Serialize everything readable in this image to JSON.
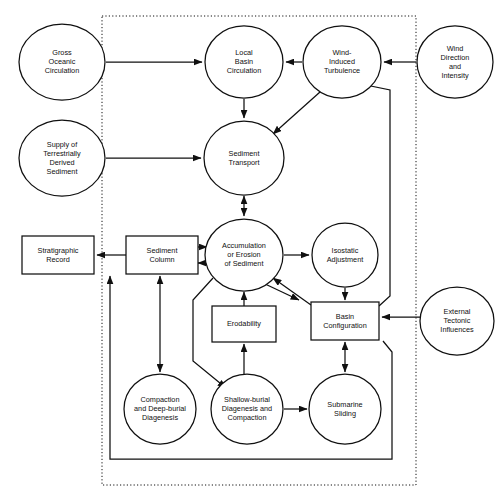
{
  "diagram": {
    "system_boundary_label": "",
    "style": {
      "stroke": "#101010",
      "fill": "#ffffff",
      "boundary_style": "dotted",
      "background": "#ffffff"
    },
    "nodes": [
      {
        "id": "gross_oceanic_circulation",
        "shape": "ellipse",
        "inside_boundary": false,
        "lines": [
          "Gross",
          "Oceanic",
          "Circulation"
        ],
        "cx": 62,
        "cy": 62,
        "rx": 43,
        "ry": 38
      },
      {
        "id": "supply_terrestrial_sediment",
        "shape": "ellipse",
        "inside_boundary": false,
        "lines": [
          "Supply of",
          "Terrestrially",
          "Derived",
          "Sediment"
        ],
        "cx": 62,
        "cy": 158,
        "rx": 43,
        "ry": 38
      },
      {
        "id": "local_basin_circulation",
        "shape": "ellipse",
        "inside_boundary": true,
        "lines": [
          "Local",
          "Basin",
          "Circulation"
        ],
        "cx": 244,
        "cy": 62,
        "rx": 39,
        "ry": 36
      },
      {
        "id": "wind_induced_turbulence",
        "shape": "ellipse",
        "inside_boundary": true,
        "lines": [
          "Wind-",
          "Induced",
          "Turbulence"
        ],
        "cx": 342,
        "cy": 62,
        "rx": 39,
        "ry": 36
      },
      {
        "id": "wind_direction_intensity",
        "shape": "ellipse",
        "inside_boundary": false,
        "lines": [
          "Wind",
          "Direction",
          "and",
          "Intensity"
        ],
        "cx": 455,
        "cy": 62,
        "rx": 38,
        "ry": 36
      },
      {
        "id": "sediment_transport",
        "shape": "ellipse",
        "inside_boundary": true,
        "lines": [
          "Sediment",
          "Transport"
        ],
        "cx": 244,
        "cy": 158,
        "rx": 40,
        "ry": 37
      },
      {
        "id": "stratigraphic_record",
        "shape": "rect",
        "inside_boundary": false,
        "lines": [
          "Stratigraphic",
          "Record"
        ],
        "x": 22,
        "y": 236,
        "w": 72,
        "h": 38
      },
      {
        "id": "sediment_column",
        "shape": "rect",
        "inside_boundary": true,
        "lines": [
          "Sediment",
          "Column"
        ],
        "x": 126,
        "y": 236,
        "w": 72,
        "h": 38
      },
      {
        "id": "accumulation_or_erosion",
        "shape": "ellipse",
        "inside_boundary": true,
        "lines": [
          "Accumulation",
          "or Erosion",
          "of Sediment"
        ],
        "cx": 244,
        "cy": 255,
        "rx": 39,
        "ry": 36
      },
      {
        "id": "isostatic_adjustment",
        "shape": "ellipse",
        "inside_boundary": true,
        "lines": [
          "Isostatic",
          "Adjustment"
        ],
        "cx": 345,
        "cy": 255,
        "rx": 33,
        "ry": 32
      },
      {
        "id": "erodability",
        "shape": "rect",
        "inside_boundary": true,
        "lines": [
          "Erodability"
        ],
        "x": 212,
        "y": 306,
        "w": 64,
        "h": 36
      },
      {
        "id": "basin_configuration",
        "shape": "rect",
        "inside_boundary": true,
        "lines": [
          "Basin",
          "Configuration"
        ],
        "x": 311,
        "y": 302,
        "w": 68,
        "h": 38
      },
      {
        "id": "external_tectonic_influences",
        "shape": "ellipse",
        "inside_boundary": false,
        "lines": [
          "External",
          "Tectonic",
          "Influences"
        ],
        "cx": 457,
        "cy": 321,
        "rx": 37,
        "ry": 34
      },
      {
        "id": "compaction_deep_burial",
        "shape": "ellipse",
        "inside_boundary": true,
        "lines": [
          "Compaction",
          "and Deep-burial",
          "Diagenesis"
        ],
        "cx": 160,
        "cy": 409,
        "rx": 36,
        "ry": 35
      },
      {
        "id": "shallow_burial_diagenesis",
        "shape": "ellipse",
        "inside_boundary": true,
        "lines": [
          "Shallow-burial",
          "Diagenesis and",
          "Compaction"
        ],
        "cx": 247,
        "cy": 409,
        "rx": 36,
        "ry": 35
      },
      {
        "id": "submarine_sliding",
        "shape": "ellipse",
        "inside_boundary": true,
        "lines": [
          "Submarine",
          "Sliding"
        ],
        "cx": 345,
        "cy": 409,
        "rx": 36,
        "ry": 35
      }
    ],
    "edges": [
      {
        "id": "gross-to-local",
        "from": "gross_oceanic_circulation",
        "to": "local_basin_circulation",
        "points": "106,62 202,62",
        "arrows": "end"
      },
      {
        "id": "wind-dir-to-turbulence",
        "from": "wind_direction_intensity",
        "to": "wind_induced_turbulence",
        "points": "416,62 384,62",
        "arrows": "end"
      },
      {
        "id": "turbulence-to-local",
        "from": "wind_induced_turbulence",
        "to": "local_basin_circulation",
        "points": "302,62 286,62",
        "arrows": "end"
      },
      {
        "id": "local-to-transport",
        "from": "local_basin_circulation",
        "to": "sediment_transport",
        "points": "244,99 244,118",
        "arrows": "end"
      },
      {
        "id": "turbulence-to-transport",
        "from": "wind_induced_turbulence",
        "to": "sediment_transport",
        "points": "320,92 273,134",
        "arrows": "end"
      },
      {
        "id": "supply-to-transport",
        "from": "supply_terrestrial_sediment",
        "to": "sediment_transport",
        "points": "106,158 201,158",
        "arrows": "end"
      },
      {
        "id": "transport-accumulation",
        "from": "sediment_transport",
        "to": "accumulation_or_erosion",
        "points": "244,196 244,216",
        "arrows": "both"
      },
      {
        "id": "column-to-record",
        "from": "sediment_column",
        "to": "stratigraphic_record",
        "points": "126,255 97,255",
        "arrows": "end"
      },
      {
        "id": "column-accumulation-out",
        "from": "sediment_column",
        "to": "accumulation_or_erosion",
        "points": "198,247 207,247",
        "arrows": "end"
      },
      {
        "id": "accumulation-column-in",
        "from": "accumulation_or_erosion",
        "to": "sediment_column",
        "points": "208,263 198,263",
        "arrows": "end"
      },
      {
        "id": "accumulation-to-isostatic",
        "from": "accumulation_or_erosion",
        "to": "isostatic_adjustment",
        "points": "284,255 309,255",
        "arrows": "end"
      },
      {
        "id": "isostatic-to-basin",
        "from": "isostatic_adjustment",
        "to": "basin_configuration",
        "points": "345,288 345,300",
        "arrows": "end"
      },
      {
        "id": "basin-to-accumulation",
        "from": "basin_configuration",
        "to": "accumulation_or_erosion",
        "points": "311,305 273,278",
        "arrows": "end"
      },
      {
        "id": "accumulation-to-basin-elbow",
        "from": "accumulation_or_erosion",
        "to": "basin_configuration",
        "points": "263,283 299,300",
        "arrows": "end"
      },
      {
        "id": "tectonic-to-basin",
        "from": "external_tectonic_influences",
        "to": "basin_configuration",
        "points": "420,317 382,317",
        "arrows": "end"
      },
      {
        "id": "erodability-to-accumulation",
        "from": "erodability",
        "to": "accumulation_or_erosion",
        "points": "244,306 244,292",
        "arrows": "end"
      },
      {
        "id": "shallow-to-erodability",
        "from": "shallow_burial_diagenesis",
        "to": "erodability",
        "points": "244,374 244,344",
        "arrows": "end"
      },
      {
        "id": "accumulation-to-shallow",
        "from": "accumulation_or_erosion",
        "to": "shallow_burial_diagenesis",
        "points": "213,278 193,300 193,361 226,388",
        "arrows": "end"
      },
      {
        "id": "column-compaction",
        "from": "sediment_column",
        "to": "compaction_deep_burial",
        "points": "160,276 160,372",
        "arrows": "both"
      },
      {
        "id": "shallow-to-submarine",
        "from": "shallow_burial_diagenesis",
        "to": "submarine_sliding",
        "points": "284,409 307,409",
        "arrows": "end"
      },
      {
        "id": "basin-submarine",
        "from": "basin_configuration",
        "to": "submarine_sliding",
        "points": "345,342 345,372",
        "arrows": "both"
      },
      {
        "id": "basin-to-turbulence-loop",
        "from": "basin_configuration",
        "to": "wind_induced_turbulence",
        "points": "379,306 390,296 390,90 361,84",
        "arrows": "end"
      },
      {
        "id": "bottom-return-to-column",
        "from": "basin_configuration",
        "to": "sediment_column",
        "points": "383,341 392,352 392,459 110,459 110,276",
        "arrows": "end"
      }
    ],
    "boundary": {
      "x": 102,
      "y": 16,
      "w": 314,
      "h": 469
    }
  }
}
